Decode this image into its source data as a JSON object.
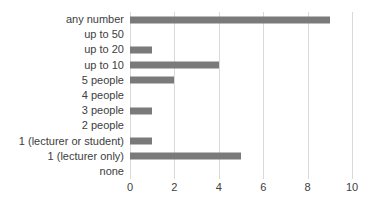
{
  "chart_data": {
    "type": "bar",
    "orientation": "horizontal",
    "title": "",
    "xlabel": "",
    "ylabel": "",
    "categories": [
      "any number",
      "up to 50",
      "up to 20",
      "up to 10",
      "5 people",
      "4 people",
      "3 people",
      "2 people",
      "1 (lecturer or student)",
      "1 (lecturer only)",
      "none"
    ],
    "values": [
      9,
      0,
      1,
      4,
      2,
      0,
      1,
      0,
      1,
      5,
      0
    ],
    "xlim": [
      0,
      10
    ],
    "xticks": [
      0,
      2,
      4,
      6,
      8,
      10
    ],
    "xtick_labels": [
      "0",
      "2",
      "4",
      "6",
      "8",
      "10"
    ],
    "grid": true,
    "legend": false,
    "bar_color": "#7a7a7a",
    "gridline_color": "#d9d9d9",
    "text_color": "#404040"
  }
}
